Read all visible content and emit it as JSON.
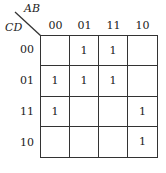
{
  "kmap": {
    "row_var": "CD",
    "col_var": "AB",
    "col_labels": [
      "00",
      "01",
      "11",
      "10"
    ],
    "row_labels": [
      "00",
      "01",
      "11",
      "10"
    ],
    "cells": [
      [
        "",
        "1",
        "1",
        ""
      ],
      [
        "1",
        "1",
        "1",
        ""
      ],
      [
        "1",
        "",
        "",
        "1"
      ],
      [
        "",
        "",
        "",
        "1"
      ]
    ]
  }
}
